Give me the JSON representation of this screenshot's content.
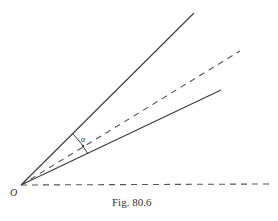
{
  "figure": {
    "caption": "Fig. 80.6",
    "origin_label": "O",
    "angle_label": "α",
    "colors": {
      "line": "#3a3a3a",
      "dashed": "#555555",
      "background": "#ffffff"
    },
    "lines": [
      {
        "name": "upper-solid-ray",
        "style": "solid",
        "from": [
          21,
          185
        ],
        "to": [
          194,
          13
        ]
      },
      {
        "name": "upper-dashed-ray",
        "style": "dashed",
        "from": [
          21,
          185
        ],
        "to": [
          240,
          51
        ]
      },
      {
        "name": "lower-solid-ray",
        "style": "solid",
        "from": [
          21,
          185
        ],
        "to": [
          221,
          90
        ]
      },
      {
        "name": "horizontal-dashed-ray",
        "style": "dashed",
        "from": [
          21,
          185
        ],
        "to": [
          270,
          184
        ]
      }
    ],
    "angle_arc": {
      "from": [
        73,
        134
      ],
      "to": [
        88,
        154
      ]
    }
  }
}
